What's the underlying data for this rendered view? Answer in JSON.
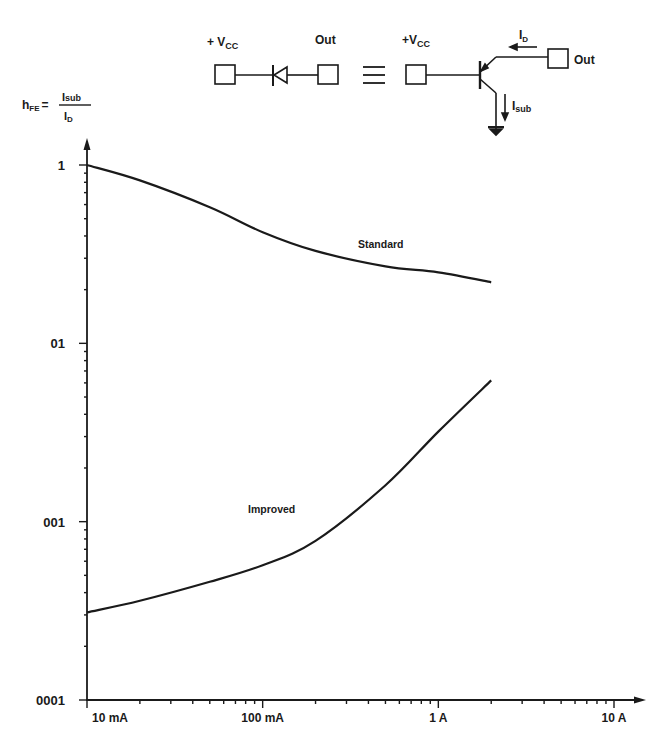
{
  "circuit": {
    "left": {
      "vcc_label": "+ V",
      "vcc_sub": "CC",
      "out_label": "Out"
    },
    "equiv_symbol": "≡",
    "right": {
      "vcc_label": "+V",
      "vcc_sub": "CC",
      "out_label": "Out",
      "id_label": "I",
      "id_sub": "D",
      "isub_label": "I",
      "isub_sub": "sub"
    }
  },
  "formula": {
    "lhs": "h",
    "lhs_sub": "FE",
    "equals": "=",
    "num": "I",
    "num_sub": "sub",
    "den": "I",
    "den_sub": "D"
  },
  "chart_data": {
    "type": "line",
    "title": "",
    "xlabel": "",
    "ylabel": "hFE = Isub / ID",
    "xscale": "log",
    "yscale": "log",
    "xlim": [
      0.01,
      10
    ],
    "ylim": [
      0.001,
      1
    ],
    "x_tick_labels": [
      "10 mA",
      "100 mA",
      "1 A",
      "10 A"
    ],
    "x_tick_values": [
      0.01,
      0.1,
      1,
      10
    ],
    "y_tick_labels": [
      "1",
      "01",
      "001",
      "0001"
    ],
    "y_tick_values": [
      1,
      0.1,
      0.01,
      0.001
    ],
    "grid": false,
    "series": [
      {
        "name": "Standard",
        "x": [
          0.01,
          0.02,
          0.05,
          0.1,
          0.2,
          0.5,
          1,
          2
        ],
        "values": [
          1.0,
          0.82,
          0.58,
          0.42,
          0.33,
          0.27,
          0.25,
          0.22
        ]
      },
      {
        "name": "Improved",
        "x": [
          0.01,
          0.02,
          0.05,
          0.1,
          0.2,
          0.5,
          1,
          2
        ],
        "values": [
          0.0031,
          0.0036,
          0.0046,
          0.0057,
          0.0078,
          0.016,
          0.032,
          0.062
        ]
      }
    ],
    "annotations": [
      {
        "text": "Standard",
        "near_x": 0.35,
        "near_y": 0.42
      },
      {
        "text": "Improved",
        "near_x": 0.06,
        "near_y": 0.0095
      }
    ]
  }
}
